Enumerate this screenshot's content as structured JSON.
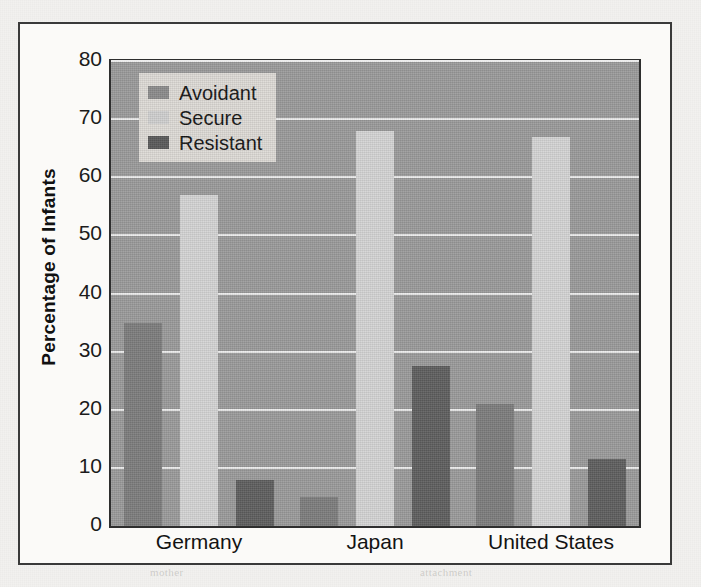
{
  "figure": {
    "background_color": "#f2f1ef",
    "frame_color": "#3a3a3a",
    "plot_background_color": "#9b9b9b",
    "gridline_color": "#ececec"
  },
  "ghost_text": [
    {
      "text": "CHAPTER",
      "x": 556,
      "y": 30
    },
    {
      "text": "Social",
      "x": 30,
      "y": 92
    },
    {
      "text": "and",
      "x": 30,
      "y": 112
    },
    {
      "text": "infant",
      "x": 430,
      "y": 214
    },
    {
      "text": "are",
      "x": 404,
      "y": 248
    },
    {
      "text": "the",
      "x": 524,
      "y": 268
    },
    {
      "text": "between",
      "x": 298,
      "y": 494
    },
    {
      "text": "mother",
      "x": 150,
      "y": 566
    },
    {
      "text": "attachment",
      "x": 420,
      "y": 566
    }
  ],
  "legend": {
    "position": "upper-left-inside",
    "background_color": "#dedbd6",
    "entries": [
      {
        "label": "Avoidant",
        "color": "#8b8b8b",
        "swatch": "avoidant-swatch"
      },
      {
        "label": "Secure",
        "color": "#cfcfcf",
        "swatch": "secure-swatch"
      },
      {
        "label": "Resistant",
        "color": "#595959",
        "swatch": "resistant-swatch"
      }
    ]
  },
  "chart_data": {
    "type": "bar",
    "title": "",
    "xlabel": "",
    "ylabel": "Percentage of Infants",
    "categories": [
      "Germany",
      "Japan",
      "United States"
    ],
    "series": [
      {
        "name": "Avoidant",
        "color": "#7d7d7d",
        "values": [
          35,
          5,
          21
        ]
      },
      {
        "name": "Secure",
        "color": "#d4d4d4",
        "values": [
          57,
          68,
          67
        ]
      },
      {
        "name": "Resistant",
        "color": "#5f5f5f",
        "values": [
          8,
          27.5,
          11.5
        ]
      }
    ],
    "ylim": [
      0,
      80
    ],
    "yticks": [
      0,
      10,
      20,
      30,
      40,
      50,
      60,
      70,
      80
    ],
    "ytick_labels": [
      "0",
      "10",
      "20",
      "30",
      "40",
      "50",
      "60",
      "70",
      "80"
    ],
    "grid": true,
    "grid_axis": "y",
    "legend_position": "upper left",
    "bar_grouping": "grouped"
  }
}
